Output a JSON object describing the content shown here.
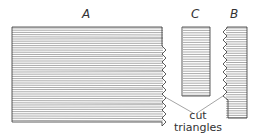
{
  "labels": {
    "a": "A",
    "b": "B",
    "c": "C",
    "caption_line1": "cut",
    "caption_line2": "triangles"
  },
  "colors": {
    "stroke": "#333333",
    "hatch": "#555555"
  }
}
